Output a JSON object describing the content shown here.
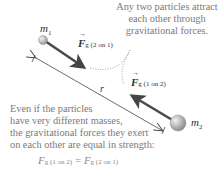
{
  "diagram": {
    "masses": {
      "m1": {
        "symbol": "m",
        "subscript": "1"
      },
      "m2": {
        "symbol": "m",
        "subscript": "2"
      }
    },
    "forces": {
      "f21": {
        "symbol": "F",
        "subscript": "g (2 on 1)"
      },
      "f12": {
        "symbol": "F",
        "subscript": "g (1 on 2)"
      }
    },
    "distance_label": "r",
    "annotation_top": [
      "Any two particles attract",
      "each other through",
      "gravitational forces."
    ],
    "annotation_bottom": [
      "Even if the particles",
      "have very different masses,",
      "the gravitational forces they exert",
      "on each other are equal in strength:"
    ],
    "equation": {
      "lhs_symbol": "F",
      "lhs_subscript": "g (1 on 2)",
      "equals": "=",
      "rhs_symbol": "F",
      "rhs_subscript": "g (2 on 1)"
    },
    "colors": {
      "arrow": "#4a4a4a",
      "sphere_light": "#f0f0f0",
      "sphere_dark": "#9a9a9a",
      "note_text": "#7a7a7a",
      "dotted": "#888888"
    }
  }
}
